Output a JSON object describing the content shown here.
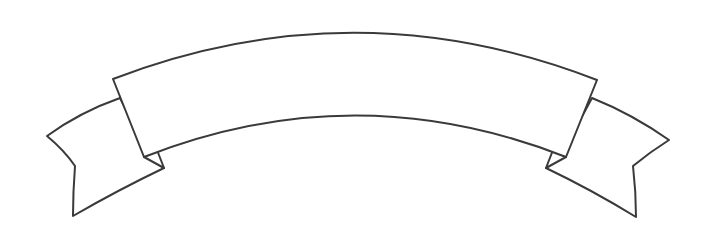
{
  "illustration": {
    "type": "curved-ribbon-banner",
    "label": "",
    "colors": {
      "outline": "#3a3a3a",
      "fill": "#ffffff",
      "background": "#ffffff"
    }
  }
}
